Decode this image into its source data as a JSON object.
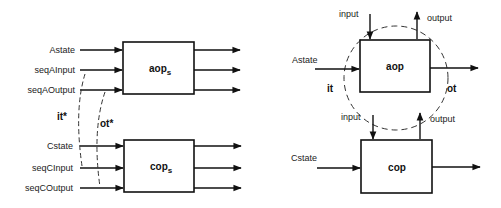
{
  "left": {
    "top_box": {
      "label": "aop",
      "subscript": "s"
    },
    "bottom_box": {
      "label": "cop",
      "subscript": "s"
    },
    "top_inputs": [
      "Astate",
      "seqAInput",
      "seqAOutput"
    ],
    "bottom_inputs": [
      "Cstate",
      "seqCInput",
      "seqCOutput"
    ],
    "link_labels": {
      "it": "it*",
      "ot": "ot*"
    }
  },
  "right": {
    "top_box": {
      "label": "aop"
    },
    "bottom_box": {
      "label": "cop"
    },
    "top_state": "Astate",
    "bottom_state": "Cstate",
    "top_input": "input",
    "top_output": "output",
    "bottom_input": "input",
    "bottom_output": "output",
    "it": "it",
    "ot": "ot"
  },
  "colors": {
    "line": "#111111",
    "text": "#222222",
    "background": "#ffffff"
  }
}
